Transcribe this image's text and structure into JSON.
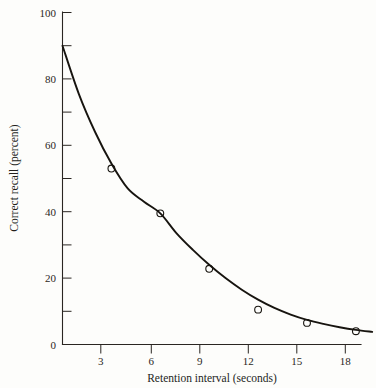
{
  "chart_data": {
    "type": "line",
    "title": "",
    "xlabel": "Retention interval (seconds)",
    "ylabel": "Correct recall (percent)",
    "xlim": [
      0,
      18
    ],
    "ylim": [
      0,
      100
    ],
    "grid": false,
    "legend": "none",
    "x_ticks_major": [
      3,
      6,
      9,
      12,
      15,
      18
    ],
    "x_tick_labels": [
      "3",
      "6",
      "9",
      "12",
      "15",
      "18"
    ],
    "y_ticks_major": [
      0,
      20,
      40,
      60,
      80,
      100
    ],
    "y_tick_labels": [
      "0",
      "20",
      "40",
      "60",
      "80",
      "100"
    ],
    "y_ticks_minor": [
      10,
      30,
      50,
      70,
      90
    ],
    "series": [
      {
        "name": "Correct recall",
        "marker": "open-circle",
        "x": [
          3,
          6,
          9,
          12,
          15,
          18
        ],
        "values": [
          53,
          39.5,
          22.8,
          10.5,
          6.5,
          4
        ]
      },
      {
        "name": "Fitted forgetting curve",
        "marker": "none",
        "x": [
          0,
          1,
          2,
          3,
          4,
          5,
          6,
          7,
          8,
          9,
          10,
          11,
          12,
          13,
          14,
          15,
          16,
          17,
          18,
          19
        ],
        "values": [
          90,
          75.5,
          64,
          54.5,
          47,
          43,
          39.5,
          33.5,
          28.5,
          24,
          20,
          16.5,
          13.5,
          11,
          9,
          7.4,
          6.2,
          5.2,
          4.4,
          3.8
        ]
      }
    ]
  },
  "axis": {
    "x_label": "Retention interval (seconds)",
    "y_label": "Correct recall (percent)"
  },
  "colors": {
    "ink": "#17140f",
    "background": "#fdfdfb"
  }
}
